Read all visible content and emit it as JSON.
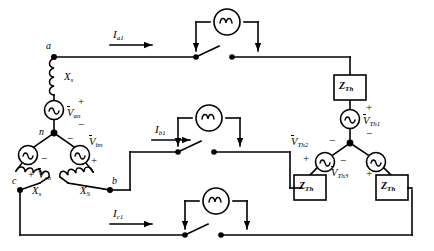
{
  "figure": {
    "type": "three-phase-circuit-diagram"
  },
  "source_network": {
    "nodes": [
      {
        "id": "a",
        "label": "a"
      },
      {
        "id": "b",
        "label": "b"
      },
      {
        "id": "c",
        "label": "c"
      },
      {
        "id": "n",
        "label": "n"
      }
    ],
    "reactances": [
      {
        "id": "xs-a",
        "label": "X",
        "sub": "s"
      },
      {
        "id": "xs-b",
        "label": "X",
        "sub": "S"
      },
      {
        "id": "xs-c",
        "label": "X",
        "sub": "s"
      }
    ],
    "sources": [
      {
        "id": "van",
        "label": "V",
        "sub": "an",
        "plus": "+",
        "minus": "−"
      },
      {
        "id": "vbn",
        "label": "V",
        "sub": "bn",
        "plus": "+",
        "minus": "−"
      },
      {
        "id": "vcn",
        "label": "V",
        "sub": "cn",
        "plus": "+",
        "minus": "−"
      }
    ]
  },
  "currents": [
    {
      "id": "ia1",
      "label": "I",
      "sub": "a1"
    },
    {
      "id": "ib1",
      "label": "I",
      "sub": "b1"
    },
    {
      "id": "ic1",
      "label": "I",
      "sub": "c1"
    }
  ],
  "breakers": [
    {
      "id": "breaker-a",
      "meter_icon": "ac-meter-icon"
    },
    {
      "id": "breaker-b",
      "meter_icon": "ac-meter-icon"
    },
    {
      "id": "breaker-c",
      "meter_icon": "ac-meter-icon"
    }
  ],
  "thevenin_network": {
    "impedances": [
      {
        "id": "zth1",
        "label": "Z",
        "sub": "Th"
      },
      {
        "id": "zth2",
        "label": "Z",
        "sub": "Th"
      },
      {
        "id": "zth3",
        "label": "Z",
        "sub": "Th"
      }
    ],
    "sources": [
      {
        "id": "vth1",
        "label": "V",
        "sub": "Th1",
        "plus": "+",
        "minus": "−"
      },
      {
        "id": "vth2",
        "label": "V",
        "sub": "Th2",
        "plus": "+",
        "minus": "−"
      },
      {
        "id": "vth3",
        "label": "V",
        "sub": "Th3",
        "plus": "+",
        "minus": "−"
      }
    ]
  },
  "colors": {
    "line": "#000000",
    "background": "#ffffff"
  }
}
